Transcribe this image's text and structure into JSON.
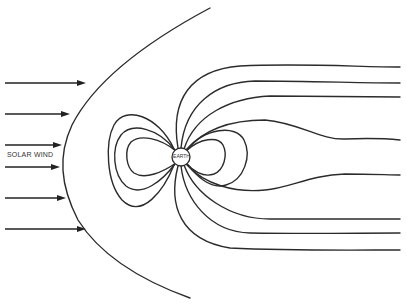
{
  "diagram": {
    "labels": {
      "solar_wind": "SOLAR WIND",
      "earth": "EARTH"
    },
    "colors": {
      "line": "#2b2b2b",
      "background": "#ffffff"
    },
    "earth": {
      "cx": 181,
      "cy": 157,
      "r": 9
    },
    "solar_wind_arrows": [
      {
        "y": 83,
        "x1": 5,
        "x2": 86
      },
      {
        "y": 114,
        "x1": 5,
        "x2": 70
      },
      {
        "y": 145,
        "x1": 5,
        "x2": 62
      },
      {
        "y": 167,
        "x1": 5,
        "x2": 60
      },
      {
        "y": 198,
        "x1": 5,
        "x2": 66
      },
      {
        "y": 229,
        "x1": 5,
        "x2": 86
      }
    ],
    "bow_shock": "M210,8 C150,40 95,80 72,125 C58,155 60,185 78,220 C100,255 140,280 190,298",
    "closed_field_lines": [
      "M176,151 C160,138 140,134 131,142 C124,150 126,167 134,173 C145,180 163,172 176,163",
      "M175,150 C158,128 132,122 121,135 C111,148 113,175 126,186 C142,198 163,180 175,164",
      "M174,149 C158,115 125,105 114,125 C105,142 106,182 122,200 C142,220 164,190 174,165",
      "M186,151 C200,138 218,136 223,145 C228,155 224,170 214,174 C203,178 192,170 186,163",
      "M187,150 C204,128 236,124 244,140 C252,156 244,180 226,185 C210,190 196,175 187,164"
    ],
    "open_field_lines": [
      "M178,148 C170,100 190,70 240,66 C300,63 360,67 400,67",
      "M181,148 C185,105 215,82 255,81 C310,81 360,83 400,83",
      "M184,149 C195,115 230,98 270,96 C320,96 360,97 400,97",
      "M186,150 C205,128 235,120 265,120 C300,123 320,140 345,139 C370,138 390,139 400,140",
      "M186,164 C205,185 235,193 265,190 C290,188 310,175 345,174 C370,174 390,175 400,175",
      "M184,165 C195,195 230,219 270,219 C320,219 360,219 400,219",
      "M181,166 C185,200 210,232 250,233 C310,234 360,233 400,233",
      "M178,166 C168,205 180,240 230,248 C290,251 360,250 400,250"
    ]
  }
}
